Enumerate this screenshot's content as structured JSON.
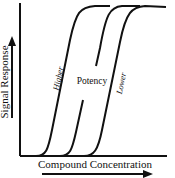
{
  "diagram": {
    "y_axis_label": "Signal Response",
    "x_axis_label": "Compound Concentration",
    "center_label": "Potency",
    "curve_labels": {
      "left": "Higher",
      "right": "Lower"
    },
    "curves": [
      {
        "name": "higher-potency-curve",
        "position": "left"
      },
      {
        "name": "middle-potency-curve",
        "position": "middle"
      },
      {
        "name": "lower-potency-curve",
        "position": "right"
      }
    ],
    "colors": {
      "line": "#111111",
      "background": "#ffffff"
    }
  }
}
